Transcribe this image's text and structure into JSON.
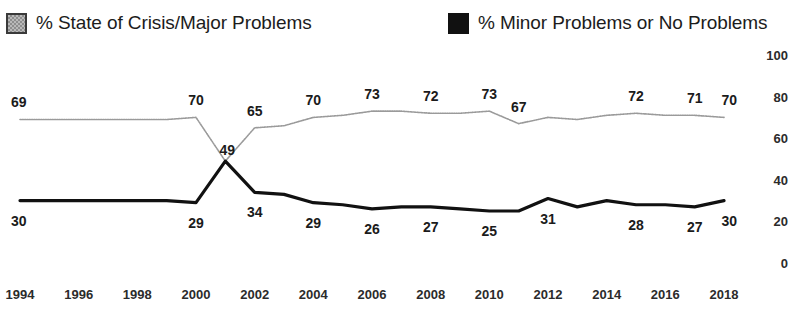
{
  "legend": {
    "items": [
      {
        "label": "% State of Crisis/Major Problems",
        "marker": "hatched-gray-square",
        "color": "#9a9a9a"
      },
      {
        "label": "% Minor Problems or No Problems",
        "marker": "solid-black-square",
        "color": "#111111"
      }
    ]
  },
  "chart_data": {
    "type": "line",
    "title": "",
    "subtitle": "",
    "xlabel": "",
    "ylabel": "",
    "ylim": [
      0,
      100
    ],
    "yticks": [
      0,
      20,
      40,
      60,
      80,
      100
    ],
    "ytick_labels": [
      "0",
      "20",
      "40",
      "60",
      "80",
      "100"
    ],
    "y_axis_position": "right",
    "grid": false,
    "legend_position": "top",
    "x": [
      1994,
      1995,
      1996,
      1997,
      1998,
      1999,
      2000,
      2001,
      2002,
      2003,
      2004,
      2005,
      2006,
      2007,
      2008,
      2009,
      2010,
      2011,
      2012,
      2013,
      2014,
      2015,
      2016,
      2017,
      2018
    ],
    "xticks": [
      1994,
      1996,
      1998,
      2000,
      2002,
      2004,
      2006,
      2008,
      2010,
      2012,
      2014,
      2016,
      2018
    ],
    "xtick_labels": [
      "1994",
      "1996",
      "1998",
      "2000",
      "2002",
      "2004",
      "2006",
      "2008",
      "2010",
      "2012",
      "2014",
      "2016",
      "2018"
    ],
    "series": [
      {
        "name": "% State of Crisis/Major Problems",
        "color": "#9a9a9a",
        "style": "dotted-thin",
        "values": [
          69,
          69,
          69,
          69,
          69,
          69,
          70,
          49,
          65,
          66,
          70,
          71,
          73,
          73,
          72,
          72,
          73,
          67,
          70,
          69,
          71,
          72,
          71,
          71,
          70
        ],
        "labels": [
          {
            "x": 1994,
            "value": 69,
            "text": "69"
          },
          {
            "x": 2000,
            "value": 70,
            "text": "70"
          },
          {
            "x": 2001,
            "value": 49,
            "text": "49"
          },
          {
            "x": 2002,
            "value": 65,
            "text": "65"
          },
          {
            "x": 2004,
            "value": 70,
            "text": "70"
          },
          {
            "x": 2006,
            "value": 73,
            "text": "73"
          },
          {
            "x": 2008,
            "value": 72,
            "text": "72"
          },
          {
            "x": 2010,
            "value": 73,
            "text": "73"
          },
          {
            "x": 2011,
            "value": 67,
            "text": "67"
          },
          {
            "x": 2015,
            "value": 72,
            "text": "72"
          },
          {
            "x": 2017,
            "value": 71,
            "text": "71"
          },
          {
            "x": 2018,
            "value": 70,
            "text": "70"
          }
        ]
      },
      {
        "name": "% Minor Problems or No Problems",
        "color": "#111111",
        "style": "solid-thick",
        "values": [
          30,
          30,
          30,
          30,
          30,
          30,
          29,
          49,
          34,
          33,
          29,
          28,
          26,
          27,
          27,
          26,
          25,
          25,
          31,
          27,
          30,
          28,
          28,
          27,
          30
        ],
        "labels": [
          {
            "x": 1994,
            "value": 30,
            "text": "30"
          },
          {
            "x": 2000,
            "value": 29,
            "text": "29"
          },
          {
            "x": 2001,
            "value": 49,
            "text": "49"
          },
          {
            "x": 2002,
            "value": 34,
            "text": "34"
          },
          {
            "x": 2004,
            "value": 29,
            "text": "29"
          },
          {
            "x": 2006,
            "value": 26,
            "text": "26"
          },
          {
            "x": 2008,
            "value": 27,
            "text": "27"
          },
          {
            "x": 2010,
            "value": 25,
            "text": "25"
          },
          {
            "x": 2012,
            "value": 31,
            "text": "31"
          },
          {
            "x": 2015,
            "value": 28,
            "text": "28"
          },
          {
            "x": 2017,
            "value": 27,
            "text": "27"
          },
          {
            "x": 2018,
            "value": 30,
            "text": "30"
          }
        ]
      }
    ]
  }
}
